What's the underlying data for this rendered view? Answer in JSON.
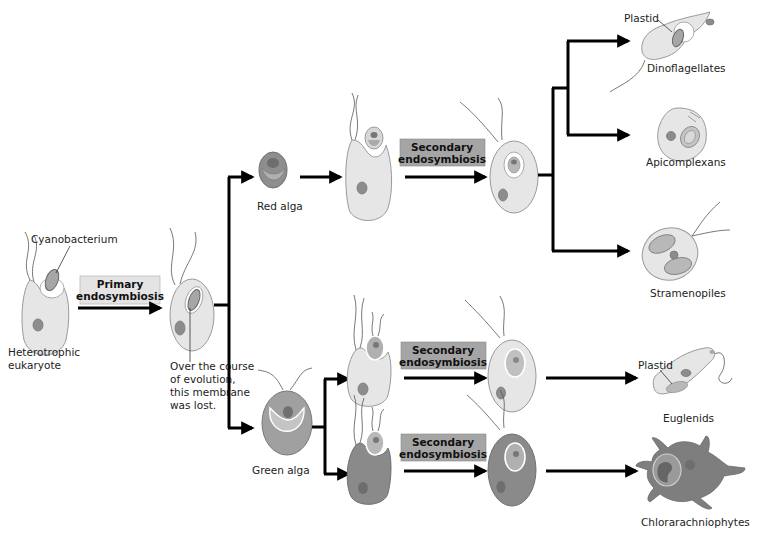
{
  "diagram": {
    "type": "endosymbiosis-evolution",
    "labels": {
      "cyanobacterium": "Cyanobacterium",
      "heterotrophic_1": "Heterotrophic",
      "heterotrophic_2": "eukaryote",
      "membrane_note_1": "Over the course",
      "membrane_note_2": "of evolution,",
      "membrane_note_3": "this membrane",
      "membrane_note_4": "was lost.",
      "red_alga": "Red alga",
      "green_alga": "Green alga",
      "plastid_dino": "Plastid",
      "plastid_eugl": "Plastid"
    },
    "processes": {
      "primary_1": "Primary",
      "primary_2": "endosymbiosis",
      "secondary_red_1": "Secondary",
      "secondary_red_2": "endosymbiosis",
      "secondary_green1_1": "Secondary",
      "secondary_green1_2": "endosymbiosis",
      "secondary_green2_1": "Secondary",
      "secondary_green2_2": "endosymbiosis"
    },
    "outcomes": {
      "dinoflagellates": "Dinoflagellates",
      "apicomplexans": "Apicomplexans",
      "stramenopiles": "Stramenopiles",
      "euglenids": "Euglenids",
      "chlorarachniophytes": "Chlorarachniophytes"
    },
    "colors": {
      "primary_box": "#e4e4e4",
      "secondary_box": "#a5a5a5",
      "arrow": "#000000",
      "cell_light": "#e6e6e6",
      "cell_dark": "#8a8a8a"
    }
  }
}
